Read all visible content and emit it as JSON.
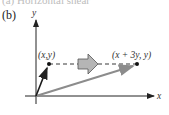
{
  "figure": {
    "cutoff_caption": "(a) Horizontal shear",
    "panel_label": "(b)",
    "axes": {
      "x_label": "x",
      "y_label": "y"
    },
    "points": [
      {
        "label": "(x,y)"
      },
      {
        "label": "(x + 3y, y)"
      }
    ],
    "colors": {
      "original_vector": "#1a1a1a",
      "image_vector": "#8c8c8c",
      "transform_arrow_fill": "#b5b5b5"
    }
  }
}
